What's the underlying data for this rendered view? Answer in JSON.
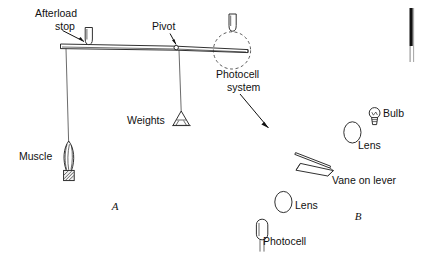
{
  "figure": {
    "background_color": "#ffffff",
    "ink_color": "#111111",
    "width": 421,
    "height": 265
  },
  "panels": [
    {
      "id": "A",
      "letter": "A",
      "x": 115,
      "y": 207,
      "description": "Muscle lever apparatus with afterload stop, pivot and weights"
    },
    {
      "id": "B",
      "letter": "B",
      "x": 358,
      "y": 217,
      "description": "Photocell system detail: bulb, lenses, vane on lever and photocell"
    }
  ],
  "panel_a": {
    "labels": {
      "afterload_stop_line1": "Afterload",
      "afterload_stop_line2": "stop",
      "pivot": "Pivot",
      "weights": "Weights",
      "muscle": "Muscle",
      "photocell_system_line1": "Photocell",
      "photocell_system_line2": "system"
    },
    "parts": [
      {
        "name": "lever-beam",
        "label": ""
      },
      {
        "name": "afterload-stop",
        "label": "Afterload stop"
      },
      {
        "name": "pivot-point",
        "label": "Pivot"
      },
      {
        "name": "weights-pan",
        "label": "Weights"
      },
      {
        "name": "muscle-preparation",
        "label": "Muscle"
      },
      {
        "name": "muscle-thread",
        "label": ""
      },
      {
        "name": "weights-thread",
        "label": ""
      },
      {
        "name": "photocell-system-highlight",
        "label": "Photocell system"
      }
    ]
  },
  "panel_b": {
    "labels": {
      "bulb": "Bulb",
      "lens_upper": "Lens",
      "vane": "Vane on lever",
      "lens_lower": "Lens",
      "photocell": "Photocell"
    },
    "parts": [
      {
        "name": "light-bulb",
        "label": "Bulb"
      },
      {
        "name": "lens-upper",
        "label": "Lens"
      },
      {
        "name": "vane-on-lever",
        "label": "Vane on lever"
      },
      {
        "name": "lens-lower",
        "label": "Lens"
      },
      {
        "name": "photocell-sensor",
        "label": "Photocell"
      }
    ]
  },
  "annotations": {
    "pointer_to_panel_b": "arrow from Photocell system label to panel B",
    "leader_afterload": "leader line from Afterload stop label to stop",
    "leader_pivot": "leader line from Pivot label to pivot circle"
  }
}
